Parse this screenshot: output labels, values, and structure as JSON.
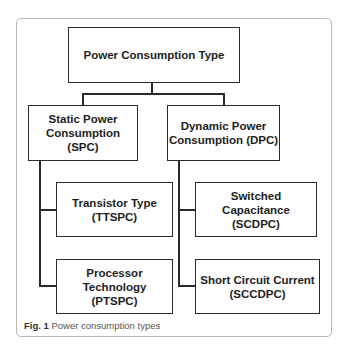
{
  "diagram": {
    "root": {
      "label": "Power Consumption Type"
    },
    "branches": [
      {
        "label": "Static Power Consumption (SPC)",
        "line1": "Static Power",
        "line2": "Consumption (SPC)",
        "children": [
          {
            "line1": "Transistor Type",
            "line2": "(TTSPC)"
          },
          {
            "line1": "Processor Technology",
            "line2": "(PTSPC)"
          }
        ]
      },
      {
        "label": "Dynamic Power Consumption (DPC)",
        "line1": "Dynamic Power",
        "line2": "Consumption (DPC)",
        "children": [
          {
            "line1": "Switched Capacitance",
            "line2": "(SCDPC)"
          },
          {
            "line1": "Short Circuit Current",
            "line2": "(SCCDPC)"
          }
        ]
      }
    ]
  },
  "caption": {
    "label": "Fig. 1",
    "text": " Power consumption types"
  },
  "colors": {
    "stroke": "#2a2a2a",
    "frame": "#b8b8b8",
    "caption": "#555555"
  }
}
